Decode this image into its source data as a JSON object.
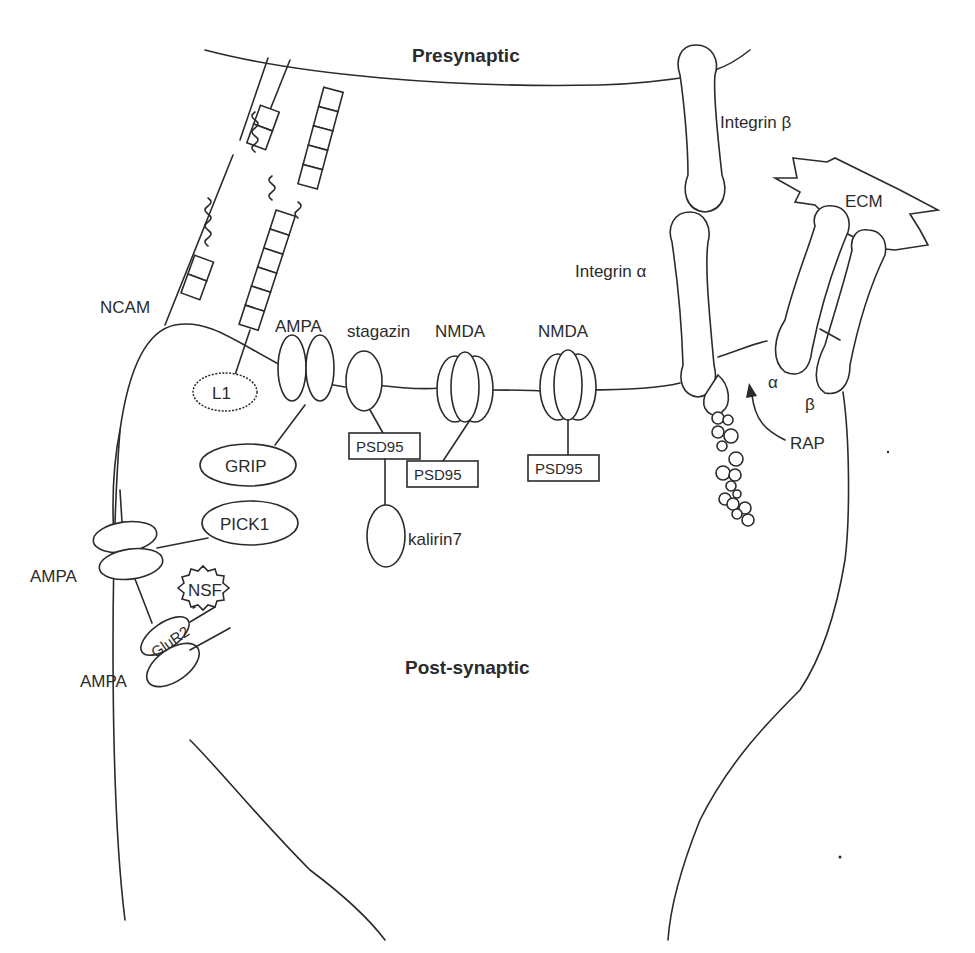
{
  "diagram": {
    "regions": {
      "presynaptic": "Presynaptic",
      "postsynaptic": "Post-synaptic"
    },
    "adhesion_molecules": {
      "ncam": "NCAM",
      "l1": "L1",
      "integrin_beta": "Integrin β",
      "integrin_alpha": "Integrin α",
      "ecm": "ECM",
      "alpha": "α",
      "beta": "β",
      "rap": "RAP"
    },
    "receptors": {
      "ampa_top": "AMPA",
      "stagazin": "stagazin",
      "nmda_1": "NMDA",
      "nmda_2": "NMDA",
      "ampa_side_1": "AMPA",
      "ampa_side_2": "AMPA",
      "glur2": "GluR2"
    },
    "scaffold_proteins": {
      "grip": "GRIP",
      "pick1": "PICK1",
      "nsf": "NSF",
      "psd95_1": "PSD95",
      "psd95_2": "PSD95",
      "psd95_3": "PSD95",
      "kalirin7": "kalirin7"
    }
  }
}
